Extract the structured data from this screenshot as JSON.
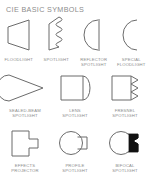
{
  "sheet": {
    "title": "CIE BASIC SYMBOLS",
    "background_color": "#ffffff",
    "stroke_color": "#6b6b6b",
    "text_color": "#8a8a8a",
    "fill_color": "#111111"
  },
  "rows": [
    {
      "symbols": [
        {
          "label": "FLOODLIGHT",
          "icon": "floodlight-trapezoid-icon"
        },
        {
          "label": "SPOTLIGHT",
          "icon": "spotlight-wavy-edge-icon"
        },
        {
          "label": "REFLECTOR\nSPOTLIGHT",
          "icon": "reflector-spotlight-arc-bar-icon"
        },
        {
          "label": "SPECIAL\nFLOODLIGHT",
          "icon": "special-floodlight-arc-icon"
        }
      ]
    },
    {
      "symbols": [
        {
          "label": "SEALED-BEAM\nSPOTLIGHT",
          "icon": "sealed-beam-spotlight-cone-icon"
        },
        {
          "label": "LENS\nSPOTLIGHT",
          "icon": "lens-spotlight-rounded-icon"
        },
        {
          "label": "FRESNEL\nSPOTLIGHT",
          "icon": "fresnel-spotlight-zigzag-icon"
        }
      ]
    },
    {
      "symbols": [
        {
          "label": "EFFECTS\nPROJECTOR",
          "icon": "effects-projector-tee-icon"
        },
        {
          "label": "PROFILE\nSPOTLIGHT",
          "icon": "profile-spotlight-circle-icon"
        },
        {
          "label": "BIFOCAL\nSPOTLIGHT",
          "icon": "bifocal-spotlight-filled-icon"
        }
      ]
    }
  ]
}
